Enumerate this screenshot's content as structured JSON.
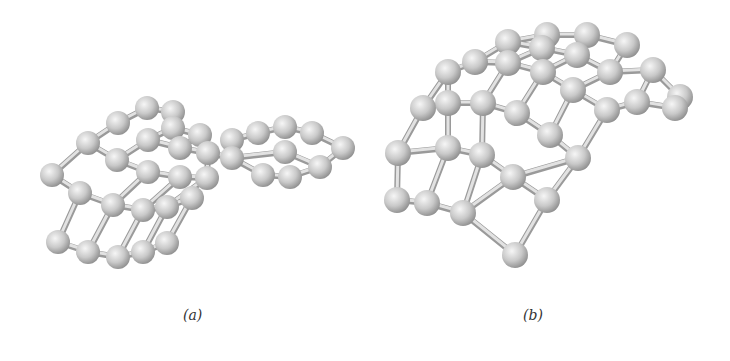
{
  "figure": {
    "panels": [
      {
        "id": "a",
        "label": "(a)",
        "description": "Ball-and-stick model of a twisted carbon sheet fragment",
        "atom_color": "#c8c8c8",
        "bond_color": "#cfcfcf",
        "atom_radius": 12,
        "atoms": [
          [
            147,
            108
          ],
          [
            173,
            112
          ],
          [
            118,
            123
          ],
          [
            173,
            128
          ],
          [
            200,
            135
          ],
          [
            88,
            143
          ],
          [
            148,
            140
          ],
          [
            180,
            148
          ],
          [
            232,
            140
          ],
          [
            258,
            133
          ],
          [
            285,
            127
          ],
          [
            312,
            133
          ],
          [
            343,
            148
          ],
          [
            117,
            160
          ],
          [
            148,
            172
          ],
          [
            208,
            153
          ],
          [
            232,
            158
          ],
          [
            52,
            175
          ],
          [
            180,
            177
          ],
          [
            207,
            178
          ],
          [
            263,
            175
          ],
          [
            290,
            177
          ],
          [
            320,
            167
          ],
          [
            285,
            152
          ],
          [
            80,
            193
          ],
          [
            113,
            205
          ],
          [
            143,
            210
          ],
          [
            167,
            207
          ],
          [
            192,
            198
          ],
          [
            58,
            242
          ],
          [
            88,
            252
          ],
          [
            118,
            257
          ],
          [
            143,
            252
          ],
          [
            167,
            243
          ]
        ],
        "bonds": [
          [
            0,
            1
          ],
          [
            0,
            2
          ],
          [
            1,
            3
          ],
          [
            2,
            5
          ],
          [
            3,
            4
          ],
          [
            3,
            6
          ],
          [
            4,
            7
          ],
          [
            5,
            13
          ],
          [
            6,
            13
          ],
          [
            6,
            7
          ],
          [
            7,
            15
          ],
          [
            8,
            9
          ],
          [
            9,
            10
          ],
          [
            10,
            11
          ],
          [
            11,
            12
          ],
          [
            8,
            16
          ],
          [
            15,
            16
          ],
          [
            13,
            14
          ],
          [
            14,
            18
          ],
          [
            18,
            19
          ],
          [
            15,
            19
          ],
          [
            16,
            23
          ],
          [
            23,
            22
          ],
          [
            22,
            12
          ],
          [
            20,
            21
          ],
          [
            21,
            22
          ],
          [
            16,
            20
          ],
          [
            5,
            17
          ],
          [
            17,
            24
          ],
          [
            24,
            25
          ],
          [
            14,
            25
          ],
          [
            25,
            26
          ],
          [
            18,
            26
          ],
          [
            26,
            27
          ],
          [
            19,
            27
          ],
          [
            27,
            28
          ],
          [
            24,
            29
          ],
          [
            25,
            30
          ],
          [
            26,
            31
          ],
          [
            27,
            32
          ],
          [
            28,
            33
          ],
          [
            29,
            30
          ],
          [
            30,
            31
          ],
          [
            31,
            32
          ],
          [
            32,
            33
          ]
        ]
      },
      {
        "id": "b",
        "label": "(b)",
        "description": "Ball-and-stick model of a curved carbon sheet fragment",
        "atom_color": "#c8c8c8",
        "bond_color": "#cfcfcf",
        "atom_radius": 13,
        "atoms": [
          [
            508,
            42
          ],
          [
            547,
            35
          ],
          [
            587,
            35
          ],
          [
            627,
            45
          ],
          [
            542,
            48
          ],
          [
            577,
            55
          ],
          [
            475,
            62
          ],
          [
            508,
            63
          ],
          [
            543,
            72
          ],
          [
            610,
            72
          ],
          [
            653,
            70
          ],
          [
            448,
            72
          ],
          [
            573,
            90
          ],
          [
            423,
            108
          ],
          [
            448,
            103
          ],
          [
            483,
            103
          ],
          [
            517,
            113
          ],
          [
            607,
            110
          ],
          [
            637,
            102
          ],
          [
            675,
            108
          ],
          [
            680,
            97
          ],
          [
            398,
            153
          ],
          [
            448,
            148
          ],
          [
            482,
            155
          ],
          [
            550,
            135
          ],
          [
            578,
            158
          ],
          [
            513,
            177
          ],
          [
            397,
            200
          ],
          [
            427,
            203
          ],
          [
            463,
            213
          ],
          [
            547,
            200
          ],
          [
            515,
            255
          ]
        ],
        "bonds": [
          [
            0,
            1
          ],
          [
            1,
            2
          ],
          [
            2,
            3
          ],
          [
            0,
            4
          ],
          [
            4,
            5
          ],
          [
            5,
            2
          ],
          [
            6,
            0
          ],
          [
            6,
            7
          ],
          [
            7,
            4
          ],
          [
            7,
            8
          ],
          [
            8,
            5
          ],
          [
            5,
            9
          ],
          [
            9,
            3
          ],
          [
            9,
            10
          ],
          [
            11,
            6
          ],
          [
            8,
            12
          ],
          [
            12,
            9
          ],
          [
            11,
            14
          ],
          [
            13,
            11
          ],
          [
            14,
            15
          ],
          [
            15,
            7
          ],
          [
            15,
            16
          ],
          [
            16,
            8
          ],
          [
            12,
            24
          ],
          [
            17,
            12
          ],
          [
            17,
            18
          ],
          [
            18,
            10
          ],
          [
            18,
            19
          ],
          [
            19,
            20
          ],
          [
            20,
            10
          ],
          [
            13,
            21
          ],
          [
            14,
            22
          ],
          [
            21,
            22
          ],
          [
            22,
            23
          ],
          [
            23,
            15
          ],
          [
            16,
            24
          ],
          [
            24,
            25
          ],
          [
            25,
            17
          ],
          [
            23,
            26
          ],
          [
            26,
            25
          ],
          [
            21,
            27
          ],
          [
            22,
            28
          ],
          [
            27,
            28
          ],
          [
            28,
            29
          ],
          [
            29,
            23
          ],
          [
            29,
            26
          ],
          [
            26,
            30
          ],
          [
            30,
            25
          ],
          [
            29,
            31
          ],
          [
            31,
            30
          ]
        ]
      }
    ]
  }
}
